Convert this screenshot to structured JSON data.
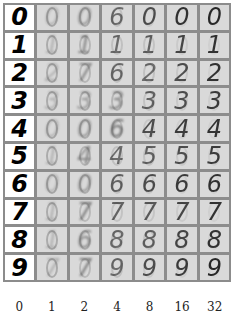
{
  "figure": {
    "rows": [
      {
        "digit": "0",
        "recon": [
          "0",
          "0",
          "6",
          "0",
          "0",
          "0"
        ],
        "opacity": [
          0.2,
          0.35,
          0.55,
          0.7,
          0.85,
          0.9
        ]
      },
      {
        "digit": "1",
        "recon": [
          "1",
          "1",
          "1",
          "1",
          "1",
          "1"
        ],
        "opacity": [
          0.2,
          0.4,
          0.55,
          0.6,
          0.75,
          0.85
        ]
      },
      {
        "digit": "2",
        "recon": [
          "2",
          "7",
          "6",
          "2",
          "2",
          "2"
        ],
        "opacity": [
          0.2,
          0.4,
          0.55,
          0.55,
          0.7,
          0.85
        ]
      },
      {
        "digit": "3",
        "recon": [
          "3",
          "3",
          "3",
          "3",
          "3",
          "3"
        ],
        "opacity": [
          0.2,
          0.3,
          0.4,
          0.6,
          0.7,
          0.8
        ]
      },
      {
        "digit": "4",
        "recon": [
          "0",
          "0",
          "6",
          "4",
          "4",
          "4"
        ],
        "opacity": [
          0.2,
          0.35,
          0.5,
          0.7,
          0.8,
          0.85
        ]
      },
      {
        "digit": "5",
        "recon": [
          "1",
          "4",
          "4",
          "5",
          "5",
          "5"
        ],
        "opacity": [
          0.2,
          0.4,
          0.55,
          0.6,
          0.7,
          0.8
        ]
      },
      {
        "digit": "6",
        "recon": [
          "0",
          "0",
          "6",
          "6",
          "6",
          "6"
        ],
        "opacity": [
          0.2,
          0.35,
          0.6,
          0.7,
          0.8,
          0.85
        ]
      },
      {
        "digit": "7",
        "recon": [
          "1",
          "7",
          "7",
          "7",
          "7",
          "7"
        ],
        "opacity": [
          0.2,
          0.45,
          0.6,
          0.65,
          0.75,
          0.85
        ]
      },
      {
        "digit": "8",
        "recon": [
          "1",
          "6",
          "8",
          "8",
          "8",
          "8"
        ],
        "opacity": [
          0.2,
          0.4,
          0.55,
          0.6,
          0.75,
          0.85
        ]
      },
      {
        "digit": "9",
        "recon": [
          "7",
          "7",
          "9",
          "9",
          "9",
          "9"
        ],
        "opacity": [
          0.2,
          0.45,
          0.55,
          0.7,
          0.8,
          0.9
        ]
      }
    ],
    "column_labels": [
      "0",
      "1",
      "2",
      "4",
      "8",
      "16",
      "32"
    ],
    "colors": {
      "grid_border": "#8c8c8c",
      "recon_bg": "#d9d9d9",
      "orig_bg": "#ffffff"
    }
  }
}
